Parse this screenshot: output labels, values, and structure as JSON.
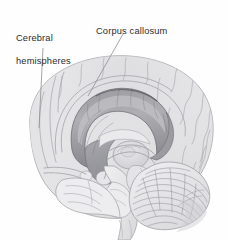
{
  "figure": {
    "medium": "graphite pencil illustration",
    "background_color": "#fefefe",
    "ink_color": "#2b2b2b",
    "width": 228,
    "height": 240
  },
  "labels": [
    {
      "id": "cerebral-hemispheres",
      "text": "Cerebral\nhemispheres",
      "line1": "Cerebral",
      "line2": "hemispheres",
      "x": 16,
      "y": 22,
      "leader": {
        "x1": 43,
        "y1": 48,
        "x2": 39,
        "y2": 128
      }
    },
    {
      "id": "corpus-callosum",
      "text": "Corpus callosum",
      "line1": "Corpus callosum",
      "x": 96,
      "y": 15,
      "leader": {
        "x1": 123,
        "y1": 34,
        "x2": 88,
        "y2": 96
      }
    }
  ],
  "structures": [
    {
      "name": "cerebral-hemisphere-outline"
    },
    {
      "name": "corpus-callosum-band"
    },
    {
      "name": "cerebellum"
    },
    {
      "name": "brainstem"
    },
    {
      "name": "thalamus"
    },
    {
      "name": "fornix"
    },
    {
      "name": "temporal-lobe"
    },
    {
      "name": "frontal-pole"
    },
    {
      "name": "occipital-pole"
    }
  ],
  "colors": {
    "paper": "#fefefe",
    "ink": "#2b2b2b",
    "graphite_light": "#d8d8da",
    "graphite_mid": "#b0b0b4",
    "graphite_dark": "#8a8a90",
    "graphite_darkest": "#6a6a70",
    "leader_line": "#9a9a9e"
  }
}
